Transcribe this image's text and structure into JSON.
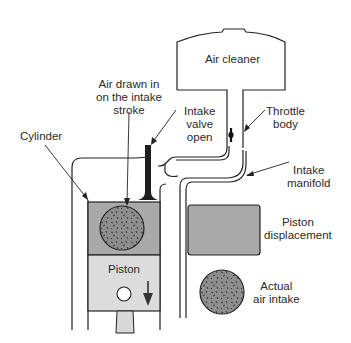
{
  "diagram": {
    "labels": {
      "air_cleaner": "Air cleaner",
      "air_drawn": [
        "Air drawn in",
        "on the intake",
        "stroke"
      ],
      "cylinder": "Cylinder",
      "intake_valve": [
        "Intake",
        "valve",
        "open"
      ],
      "throttle_body": [
        "Throttle",
        "body"
      ],
      "intake_manifold": [
        "Intake",
        "manifold"
      ],
      "piston": "Piston",
      "legend_displacement": [
        "Piston",
        "displacement"
      ],
      "legend_actual": [
        "Actual",
        "air intake"
      ]
    },
    "colors": {
      "line": "#222222",
      "displacement_fill": "#a9a9a9",
      "piston_fill": "#dcdcdc",
      "air_fill": "#8e8e8e",
      "valve": "#1e1e1e",
      "background": "#ffffff"
    },
    "icons": {
      "piston_motion": "arrow-down-icon",
      "throttle_plate": "throttle-plate-icon",
      "wrist_pin": "circle-icon"
    }
  }
}
